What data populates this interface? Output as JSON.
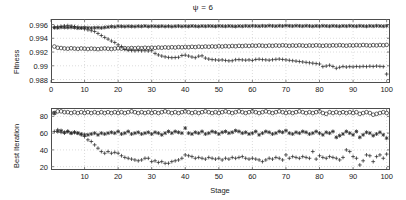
{
  "figure": {
    "title": "ψ = 6",
    "background": "#ffffff",
    "axis_color": "#4d4d4d",
    "marker_color": "#2b2b2b",
    "grid_color": "#b9b9b9"
  },
  "chart_data": [
    {
      "type": "scatter",
      "title": "ψ = 6",
      "panel": "top",
      "xlabel": "",
      "ylabel": "Fitness",
      "xlim": [
        0,
        101
      ],
      "ylim": [
        0.9875,
        0.9968
      ],
      "xticks": [
        0,
        10,
        20,
        30,
        40,
        50,
        60,
        70,
        80,
        90,
        100
      ],
      "yticks": [
        0.988,
        0.99,
        0.992,
        0.994,
        0.996
      ],
      "ytick_labels": [
        "0.988",
        "0.99",
        "0.992",
        "0.994",
        "0.996"
      ],
      "grid": true,
      "legend": "none",
      "x": [
        1,
        2,
        3,
        4,
        5,
        6,
        7,
        8,
        9,
        10,
        11,
        12,
        13,
        14,
        15,
        16,
        17,
        18,
        19,
        20,
        21,
        22,
        23,
        24,
        25,
        26,
        27,
        28,
        29,
        30,
        31,
        32,
        33,
        34,
        35,
        36,
        37,
        38,
        39,
        40,
        41,
        42,
        43,
        44,
        45,
        46,
        47,
        48,
        49,
        50,
        51,
        52,
        53,
        54,
        55,
        56,
        57,
        58,
        59,
        60,
        61,
        62,
        63,
        64,
        65,
        66,
        67,
        68,
        69,
        70,
        71,
        72,
        73,
        74,
        75,
        76,
        77,
        78,
        79,
        80,
        81,
        82,
        83,
        84,
        85,
        86,
        87,
        88,
        89,
        90,
        91,
        92,
        93,
        94,
        95,
        96,
        97,
        98,
        99,
        100
      ],
      "series": [
        {
          "name": "series-star",
          "marker": "star",
          "values": [
            0.99555,
            0.99552,
            0.9956,
            0.99558,
            0.99556,
            0.99559,
            0.99557,
            0.99548,
            0.99552,
            0.99556,
            0.99553,
            0.99549,
            0.99553,
            0.99556,
            0.99551,
            0.99558,
            0.99563,
            0.9957,
            0.99566,
            0.99575,
            0.99573,
            0.9957,
            0.99574,
            0.99572,
            0.9957,
            0.99575,
            0.99573,
            0.99578,
            0.99571,
            0.99576,
            0.99574,
            0.99572,
            0.99576,
            0.99571,
            0.99575,
            0.9957,
            0.99574,
            0.99577,
            0.99572,
            0.99576,
            0.99573,
            0.99578,
            0.99575,
            0.99572,
            0.99577,
            0.99574,
            0.99578,
            0.99576,
            0.99573,
            0.99579,
            0.99576,
            0.99574,
            0.99578,
            0.99575,
            0.99572,
            0.99577,
            0.99574,
            0.99579,
            0.99576,
            0.99581,
            0.99578,
            0.99575,
            0.9958,
            0.99577,
            0.99583,
            0.99579,
            0.99576,
            0.99581,
            0.99578,
            0.99584,
            0.9958,
            0.99577,
            0.99582,
            0.99579,
            0.99576,
            0.99581,
            0.99578,
            0.99574,
            0.99579,
            0.99576,
            0.99581,
            0.99578,
            0.99575,
            0.9958,
            0.99577,
            0.99574,
            0.99579,
            0.99576,
            0.99581,
            0.99578,
            0.99575,
            0.9958,
            0.99577,
            0.99574,
            0.99579,
            0.99576,
            0.99581,
            0.99578,
            0.99575,
            0.9958
          ]
        },
        {
          "name": "series-circle",
          "marker": "circle-open",
          "values": [
            0.9928,
            0.99262,
            0.99258,
            0.99252,
            0.99248,
            0.99255,
            0.9925,
            0.99246,
            0.99252,
            0.99248,
            0.99244,
            0.9925,
            0.99246,
            0.99242,
            0.99248,
            0.99252,
            0.99248,
            0.99244,
            0.9925,
            0.99254,
            0.9925,
            0.99256,
            0.99252,
            0.99258,
            0.99254,
            0.9926,
            0.99256,
            0.99262,
            0.99258,
            0.99264,
            0.9926,
            0.99266,
            0.99262,
            0.99268,
            0.99264,
            0.9927,
            0.99266,
            0.99272,
            0.99268,
            0.99274,
            0.9927,
            0.99276,
            0.99272,
            0.99278,
            0.99274,
            0.9928,
            0.99276,
            0.99282,
            0.99278,
            0.99284,
            0.9928,
            0.99286,
            0.99282,
            0.99288,
            0.99284,
            0.9929,
            0.99286,
            0.99292,
            0.99288,
            0.99294,
            0.9929,
            0.99296,
            0.99292,
            0.99288,
            0.99294,
            0.9929,
            0.99296,
            0.99292,
            0.99298,
            0.99294,
            0.9929,
            0.99296,
            0.99292,
            0.99298,
            0.99294,
            0.9929,
            0.99296,
            0.99292,
            0.99298,
            0.99294,
            0.9929,
            0.99296,
            0.99292,
            0.99298,
            0.99294,
            0.993,
            0.99296,
            0.99292,
            0.99298,
            0.99294,
            0.993,
            0.99296,
            0.99302,
            0.99298,
            0.99294,
            0.993,
            0.99296,
            0.99302,
            0.99298,
            0.99304
          ]
        },
        {
          "name": "series-plus",
          "marker": "plus",
          "values": [
            0.9956,
            0.99565,
            0.99572,
            0.9958,
            0.99584,
            0.99578,
            0.9957,
            0.99562,
            0.99548,
            0.99535,
            0.99522,
            0.9951,
            0.99498,
            0.9947,
            0.9944,
            0.99412,
            0.99388,
            0.9936,
            0.99338,
            0.99305,
            0.9928,
            0.99238,
            0.99226,
            0.99222,
            0.99218,
            0.99222,
            0.99218,
            0.9922,
            0.99216,
            0.9922,
            0.9918,
            0.99158,
            0.99142,
            0.9913,
            0.99122,
            0.99118,
            0.9912,
            0.99124,
            0.9915,
            0.99155,
            0.99142,
            0.99128,
            0.99118,
            0.9914,
            0.99145,
            0.99112,
            0.99098,
            0.9909,
            0.99086,
            0.99082,
            0.99086,
            0.99078,
            0.99072,
            0.99074,
            0.99088,
            0.9909,
            0.99086,
            0.99082,
            0.99086,
            0.99078,
            0.99092,
            0.99096,
            0.9909,
            0.99086,
            0.99082,
            0.99088,
            0.99094,
            0.99098,
            0.99092,
            0.99086,
            0.9908,
            0.99074,
            0.99068,
            0.99062,
            0.99056,
            0.9905,
            0.99044,
            0.99038,
            0.99032,
            0.99026,
            0.98988,
            0.98996,
            0.99008,
            0.9899,
            0.98964,
            0.98978,
            0.9899,
            0.98982,
            0.98988,
            0.98984,
            0.9899,
            0.98986,
            0.98992,
            0.98988,
            0.98994,
            0.9899,
            0.98996,
            0.98992,
            0.98988,
            0.9888
          ]
        }
      ]
    },
    {
      "type": "scatter",
      "panel": "bottom",
      "title": "",
      "xlabel": "Stage",
      "ylabel": "Best Iteration",
      "xlim": [
        0,
        101
      ],
      "ylim": [
        16,
        90
      ],
      "xticks": [
        10,
        20,
        30,
        40,
        50,
        60,
        70,
        80,
        90,
        100
      ],
      "yticks": [
        20,
        40,
        60,
        80
      ],
      "ytick_labels": [
        "20",
        "40",
        "60",
        "80"
      ],
      "grid": true,
      "legend": "none",
      "x": [
        1,
        2,
        3,
        4,
        5,
        6,
        7,
        8,
        9,
        10,
        11,
        12,
        13,
        14,
        15,
        16,
        17,
        18,
        19,
        20,
        21,
        22,
        23,
        24,
        25,
        26,
        27,
        28,
        29,
        30,
        31,
        32,
        33,
        34,
        35,
        36,
        37,
        38,
        39,
        40,
        41,
        42,
        43,
        44,
        45,
        46,
        47,
        48,
        49,
        50,
        51,
        52,
        53,
        54,
        55,
        56,
        57,
        58,
        59,
        60,
        61,
        62,
        63,
        64,
        65,
        66,
        67,
        68,
        69,
        70,
        71,
        72,
        73,
        74,
        75,
        76,
        77,
        78,
        79,
        80,
        81,
        82,
        83,
        84,
        85,
        86,
        87,
        88,
        89,
        90,
        91,
        92,
        93,
        94,
        95,
        96,
        97,
        98,
        99,
        100
      ],
      "series": [
        {
          "name": "series-circle",
          "marker": "circle-open",
          "values": [
            84,
            86,
            86,
            85,
            85,
            84,
            85,
            84,
            85,
            84,
            85,
            84,
            85,
            84,
            85,
            84,
            85,
            84,
            85,
            84,
            85,
            84,
            85,
            86,
            85,
            84,
            85,
            84,
            85,
            84,
            85,
            84,
            85,
            86,
            85,
            84,
            85,
            84,
            85,
            86,
            85,
            84,
            85,
            84,
            85,
            86,
            85,
            84,
            85,
            84,
            85,
            86,
            85,
            84,
            85,
            86,
            85,
            84,
            85,
            86,
            85,
            84,
            85,
            86,
            85,
            84,
            85,
            86,
            85,
            84,
            85,
            84,
            85,
            86,
            85,
            84,
            85,
            84,
            85,
            86,
            84,
            83,
            85,
            84,
            85,
            84,
            85,
            84,
            85,
            84,
            85,
            83,
            84,
            85,
            84,
            82,
            83,
            84,
            85,
            84
          ]
        },
        {
          "name": "series-star",
          "marker": "star",
          "values": [
            84,
            62,
            63,
            61,
            62,
            60,
            61,
            60,
            59,
            58,
            58,
            59,
            60,
            58,
            60,
            59,
            60,
            61,
            60,
            62,
            59,
            60,
            62,
            59,
            60,
            61,
            59,
            60,
            61,
            59,
            61,
            60,
            58,
            60,
            62,
            60,
            62,
            61,
            60,
            66,
            60,
            59,
            61,
            60,
            62,
            59,
            60,
            62,
            61,
            59,
            61,
            62,
            60,
            61,
            63,
            62,
            60,
            61,
            59,
            60,
            62,
            58,
            60,
            62,
            61,
            59,
            60,
            62,
            61,
            63,
            60,
            59,
            61,
            60,
            62,
            61,
            59,
            60,
            62,
            60,
            58,
            61,
            60,
            62,
            55,
            57,
            59,
            62,
            60,
            58,
            62,
            55,
            58,
            61,
            60,
            57,
            59,
            61,
            58,
            54
          ]
        },
        {
          "name": "series-plus",
          "marker": "plus",
          "values": [
            62,
            64,
            61,
            60,
            62,
            60,
            61,
            60,
            58,
            56,
            52,
            50,
            46,
            42,
            38,
            36,
            38,
            36,
            37,
            36,
            33,
            31,
            30,
            29,
            28,
            27,
            28,
            30,
            30,
            26,
            27,
            25,
            26,
            24,
            24,
            26,
            27,
            28,
            30,
            34,
            33,
            32,
            30,
            31,
            30,
            29,
            31,
            30,
            29,
            30,
            28,
            30,
            29,
            31,
            30,
            31,
            32,
            30,
            29,
            30,
            29,
            28,
            26,
            28,
            30,
            29,
            31,
            30,
            28,
            34,
            30,
            32,
            31,
            30,
            32,
            31,
            30,
            38,
            29,
            33,
            31,
            30,
            32,
            31,
            30,
            28,
            31,
            40,
            38,
            32,
            30,
            22,
            27,
            34,
            33,
            26,
            32,
            34,
            30,
            35
          ]
        }
      ]
    }
  ]
}
